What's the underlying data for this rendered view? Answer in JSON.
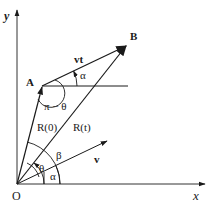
{
  "diagram": {
    "axes": {
      "x_label": "x",
      "y_label": "y",
      "origin_label": "O"
    },
    "points": {
      "A": "A",
      "B": "B"
    },
    "vectors": {
      "R0": "R(0)",
      "Rt": "R(t)",
      "v": "v",
      "vt": "vt"
    },
    "angles": {
      "alpha_top": "α",
      "pi_minus_theta": "π − θ",
      "theta": "θ",
      "beta": "β",
      "alpha_bottom": "α"
    },
    "colors": {
      "line": "#1a1a1a",
      "axis": "#333333",
      "background": "#ffffff"
    }
  }
}
